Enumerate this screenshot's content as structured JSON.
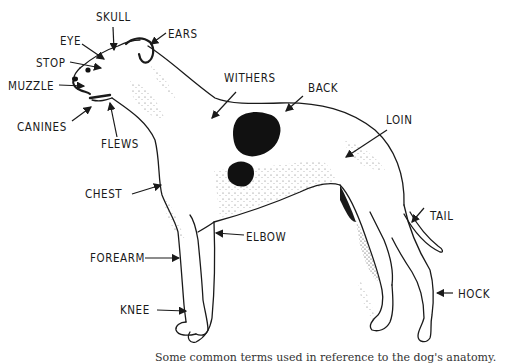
{
  "diagram": {
    "subject": "dog",
    "labels": [
      {
        "id": "skull",
        "text": "SKULL",
        "x": 96,
        "y": 11
      },
      {
        "id": "eye",
        "text": "EYE",
        "x": 60,
        "y": 35
      },
      {
        "id": "ears",
        "text": "EARS",
        "x": 168,
        "y": 28
      },
      {
        "id": "stop",
        "text": "STOP",
        "x": 36,
        "y": 57
      },
      {
        "id": "muzzle",
        "text": "MUZZLE",
        "x": 8,
        "y": 80
      },
      {
        "id": "canines",
        "text": "CANINES",
        "x": 17,
        "y": 121
      },
      {
        "id": "flews",
        "text": "FLEWS",
        "x": 101,
        "y": 138
      },
      {
        "id": "withers",
        "text": "WITHERS",
        "x": 224,
        "y": 72
      },
      {
        "id": "back",
        "text": "BACK",
        "x": 308,
        "y": 82
      },
      {
        "id": "loin",
        "text": "LOIN",
        "x": 386,
        "y": 114
      },
      {
        "id": "chest",
        "text": "CHEST",
        "x": 85,
        "y": 188
      },
      {
        "id": "elbow",
        "text": "ELBOW",
        "x": 246,
        "y": 231
      },
      {
        "id": "tail",
        "text": "TAIL",
        "x": 430,
        "y": 210
      },
      {
        "id": "forearm",
        "text": "FOREARM",
        "x": 90,
        "y": 252
      },
      {
        "id": "hock",
        "text": "HOCK",
        "x": 458,
        "y": 288
      },
      {
        "id": "knee",
        "text": "KNEE",
        "x": 120,
        "y": 304
      }
    ],
    "caption": "Some common terms used in reference to the dog's anatomy."
  },
  "colors": {
    "ink": "#1a1a1a",
    "background": "#ffffff"
  }
}
